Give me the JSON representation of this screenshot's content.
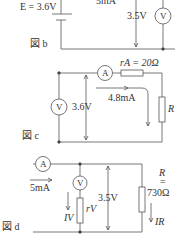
{
  "figure_b": {
    "caption": "図 b",
    "source_label": "E = 3.6V",
    "current_label": "5mA",
    "voltage_label": "3.5V",
    "voltmeter_symbol": "V"
  },
  "figure_c": {
    "caption": "図 c",
    "ammeter_symbol": "A",
    "ammeter_resistance_label": "rA = 20Ω",
    "voltmeter_symbol": "V",
    "voltage_label": "3.6V",
    "current_label": "4.8mA",
    "resistor_label": "R"
  },
  "figure_d": {
    "caption": "図 d",
    "ammeter_symbol": "A",
    "current_label": "5mA",
    "voltmeter_symbol": "V",
    "voltmeter_resistance_label": "rV",
    "voltmeter_current_label": "IV",
    "voltage_label": "3.5V",
    "resistor_label": "R",
    "resistor_eq": "=",
    "resistor_value": "730Ω",
    "resistor_current_label": "IR"
  }
}
